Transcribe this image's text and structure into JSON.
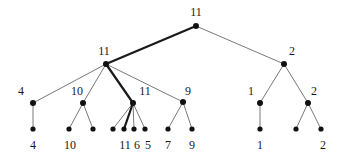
{
  "figure": {
    "type": "tree-diagram",
    "title": "",
    "background_color": "#ffffff",
    "edge_color": "#555555",
    "highlight_edge_color": "#1a1a1a",
    "node_color": "#111111",
    "label_color": "#1a1a1a"
  },
  "nodes": [
    {
      "id": "root",
      "label": "11",
      "x": 196,
      "y": 26,
      "label_x": 196,
      "label_y": 12,
      "level": 0
    },
    {
      "id": "n-l",
      "label": "11",
      "x": 106,
      "y": 64,
      "label_x": 104,
      "label_y": 51,
      "level": 1
    },
    {
      "id": "n-r",
      "label": "2",
      "x": 284,
      "y": 64,
      "label_x": 292,
      "label_y": 51,
      "level": 1
    },
    {
      "id": "n-l1",
      "label": "4",
      "x": 33,
      "y": 103,
      "label_x": 21,
      "label_y": 91,
      "level": 2
    },
    {
      "id": "n-l2",
      "label": "10",
      "x": 83,
      "y": 103,
      "label_x": 77,
      "label_y": 91,
      "level": 2
    },
    {
      "id": "n-l3",
      "label": "11",
      "x": 133,
      "y": 103,
      "label_x": 145,
      "label_y": 91,
      "level": 2
    },
    {
      "id": "n-l4",
      "label": "9",
      "x": 183,
      "y": 102,
      "label_x": 188,
      "label_y": 91,
      "level": 2
    },
    {
      "id": "n-r1",
      "label": "1",
      "x": 260,
      "y": 103,
      "label_x": 251,
      "label_y": 91,
      "level": 2
    },
    {
      "id": "n-r2",
      "label": "2",
      "x": 308,
      "y": 103,
      "label_x": 314,
      "label_y": 91,
      "level": 2
    },
    {
      "id": "leaf-1",
      "label": "4",
      "x": 33,
      "y": 129,
      "label_x": 33,
      "label_y": 145,
      "level": 3
    },
    {
      "id": "leaf-2",
      "label": "10",
      "x": 69,
      "y": 129,
      "label_x": 70,
      "label_y": 145,
      "level": 3
    },
    {
      "id": "leaf-3",
      "label": "",
      "x": 93,
      "y": 129,
      "label_x": 93,
      "label_y": 145,
      "level": 3
    },
    {
      "id": "leaf-4",
      "label": "",
      "x": 113,
      "y": 129,
      "label_x": 113,
      "label_y": 145,
      "level": 3
    },
    {
      "id": "leaf-5",
      "label": "11",
      "x": 124,
      "y": 129,
      "label_x": 125,
      "label_y": 145,
      "level": 3
    },
    {
      "id": "leaf-6",
      "label": "6",
      "x": 134,
      "y": 129,
      "label_x": 137,
      "label_y": 145,
      "level": 3
    },
    {
      "id": "leaf-7",
      "label": "5",
      "x": 145,
      "y": 129,
      "label_x": 148,
      "label_y": 145,
      "level": 3
    },
    {
      "id": "leaf-8",
      "label": "7",
      "x": 168,
      "y": 129,
      "label_x": 168,
      "label_y": 145,
      "level": 3
    },
    {
      "id": "leaf-9",
      "label": "9",
      "x": 192,
      "y": 129,
      "label_x": 192,
      "label_y": 145,
      "level": 3
    },
    {
      "id": "leaf-10",
      "label": "1",
      "x": 260,
      "y": 129,
      "label_x": 260,
      "label_y": 145,
      "level": 3
    },
    {
      "id": "leaf-11",
      "label": "",
      "x": 296,
      "y": 129,
      "label_x": 296,
      "label_y": 145,
      "level": 3
    },
    {
      "id": "leaf-12",
      "label": "2",
      "x": 321,
      "y": 129,
      "label_x": 323,
      "label_y": 145,
      "level": 3
    }
  ],
  "edges": [
    {
      "from": "root",
      "to": "n-l",
      "highlight": true
    },
    {
      "from": "root",
      "to": "n-r",
      "highlight": false
    },
    {
      "from": "n-l",
      "to": "n-l1",
      "highlight": false
    },
    {
      "from": "n-l",
      "to": "n-l2",
      "highlight": false
    },
    {
      "from": "n-l",
      "to": "n-l3",
      "highlight": true
    },
    {
      "from": "n-l",
      "to": "n-l4",
      "highlight": false
    },
    {
      "from": "n-r",
      "to": "n-r1",
      "highlight": false
    },
    {
      "from": "n-r",
      "to": "n-r2",
      "highlight": false
    },
    {
      "from": "n-l1",
      "to": "leaf-1",
      "highlight": false
    },
    {
      "from": "n-l2",
      "to": "leaf-2",
      "highlight": false
    },
    {
      "from": "n-l2",
      "to": "leaf-3",
      "highlight": false
    },
    {
      "from": "n-l3",
      "to": "leaf-4",
      "highlight": false
    },
    {
      "from": "n-l3",
      "to": "leaf-5",
      "highlight": true
    },
    {
      "from": "n-l3",
      "to": "leaf-6",
      "highlight": false
    },
    {
      "from": "n-l3",
      "to": "leaf-7",
      "highlight": false
    },
    {
      "from": "n-l4",
      "to": "leaf-8",
      "highlight": false
    },
    {
      "from": "n-l4",
      "to": "leaf-9",
      "highlight": false
    },
    {
      "from": "n-r1",
      "to": "leaf-10",
      "highlight": false
    },
    {
      "from": "n-r2",
      "to": "leaf-11",
      "highlight": false
    },
    {
      "from": "n-r2",
      "to": "leaf-12",
      "highlight": false
    }
  ]
}
